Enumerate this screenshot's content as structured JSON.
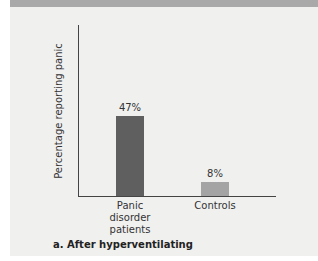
{
  "chart_data": {
    "type": "bar",
    "title": "",
    "caption": "a. After hyperventilating",
    "xlabel": "",
    "ylabel": "Percentage reporting panic",
    "categories": [
      "Panic disorder patients",
      "Controls"
    ],
    "values": [
      47,
      8
    ],
    "value_labels": [
      "47%",
      "8%"
    ],
    "colors": [
      "#5f5f5f",
      "#a4a4a4"
    ],
    "ylim": [
      0,
      100
    ],
    "grid": false,
    "legend": null
  },
  "labels": {
    "cat1_line1": "Panic disorder",
    "cat1_line2": "patients",
    "cat2": "Controls"
  }
}
